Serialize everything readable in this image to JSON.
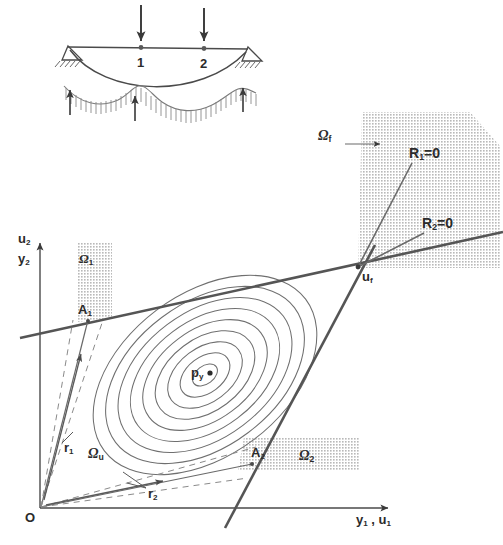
{
  "figure": {
    "type": "diagram",
    "background": "#ffffff",
    "ink": "#3a3a3a",
    "shade": "#cfcfcf",
    "thick_line": "#555555"
  },
  "structure": {
    "name": "cable-beam-structure",
    "nodes": [
      {
        "id": "node-1",
        "label": "1",
        "x": 141,
        "y": 53
      },
      {
        "id": "node-2",
        "label": "2",
        "x": 204,
        "y": 53
      }
    ],
    "load_arrows": [
      {
        "name": "load-arrow-1",
        "x": 141,
        "y_top": 5,
        "y_bottom": 42,
        "direction": "down"
      },
      {
        "name": "load-arrow-2",
        "x": 204,
        "y_top": 8,
        "y_bottom": 42,
        "direction": "down"
      }
    ],
    "reaction_arrows": [
      {
        "name": "reaction-arrow-left",
        "x": 70,
        "y_top": 90,
        "y_bottom": 115,
        "direction": "up"
      },
      {
        "name": "reaction-arrow-mid",
        "x": 135,
        "y_top": 96,
        "y_bottom": 121,
        "direction": "up"
      },
      {
        "name": "reaction-arrow-right",
        "x": 243,
        "y_top": 88,
        "y_bottom": 112,
        "direction": "up"
      }
    ]
  },
  "plot": {
    "origin": {
      "label": "O",
      "x": 40,
      "y": 508
    },
    "axes": {
      "x_label": "y₁ , u₁",
      "x_label_parts": [
        "y",
        "1",
        " , ",
        "u",
        "1"
      ],
      "y_label_top": "u₂",
      "y_label_bottom": "y₂"
    },
    "center_point": {
      "name": "p_y",
      "label_main": "p",
      "label_sub": "y",
      "x": 205,
      "y": 375
    },
    "intersection_point": {
      "label_main": "u",
      "label_sub": "f",
      "x": 358,
      "y": 267
    },
    "regions": [
      {
        "name": "omega-f",
        "label_main": "Ω",
        "label_sub": "f",
        "label_x": 325,
        "label_y": 136
      },
      {
        "name": "omega-1",
        "label_main": "Ω",
        "label_sub": "1",
        "label_x": 79,
        "label_y": 258
      },
      {
        "name": "omega-2",
        "label_main": "Ω",
        "label_sub": "2",
        "label_x": 300,
        "label_y": 455
      },
      {
        "name": "omega-u",
        "label_main": "Ω",
        "label_sub": "u",
        "label_x": 90,
        "label_y": 452
      }
    ],
    "constraint_lines": [
      {
        "name": "r1-equals-zero",
        "label_main": "R",
        "label_sub": "1",
        "label_suffix": "=0",
        "label_x": 411,
        "label_y": 152
      },
      {
        "name": "r2-equals-zero",
        "label_main": "R",
        "label_sub": "2",
        "label_suffix": "=0",
        "label_x": 424,
        "label_y": 222
      }
    ],
    "contact_points": [
      {
        "name": "A1",
        "label_main": "A",
        "label_sub": "1",
        "label_x": 80,
        "label_y": 310
      },
      {
        "name": "A2",
        "label_main": "A",
        "label_sub": "2",
        "label_x": 252,
        "label_y": 452
      }
    ],
    "rays": [
      {
        "name": "r1",
        "label_main": "r",
        "label_sub": "1",
        "label_x": 64,
        "label_y": 447
      },
      {
        "name": "r2",
        "label_main": "r",
        "label_sub": "2",
        "label_x": 148,
        "label_y": 493
      }
    ],
    "contours": {
      "count": 9,
      "tilt_deg": -37,
      "center_x": 205,
      "center_y": 375
    }
  }
}
